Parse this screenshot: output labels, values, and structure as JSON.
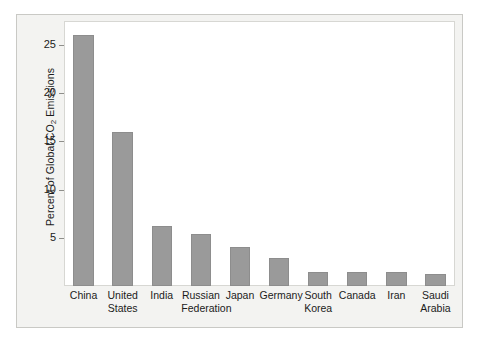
{
  "chart_data": {
    "type": "bar",
    "title": "",
    "xlabel": "",
    "ylabel": "Percent of Global CO2 Emissions",
    "ylabel_parts": {
      "before": "Percent of Global CO",
      "sub": "2",
      "after": " Emissions"
    },
    "categories": [
      "China",
      "United\nStates",
      "India",
      "Russian\nFederation",
      "Japan",
      "Germany",
      "South\nKorea",
      "Canada",
      "Iran",
      "Saudi\nArabia"
    ],
    "values": [
      26.0,
      16.0,
      6.2,
      5.4,
      4.0,
      2.9,
      1.5,
      1.5,
      1.5,
      1.2
    ],
    "ylim": [
      0,
      27.5
    ],
    "yticks": [
      5,
      10,
      15,
      20,
      25
    ],
    "ytick_labels": [
      "5",
      "10",
      "15",
      "20",
      "25"
    ],
    "grid": false,
    "legend": false,
    "bar_color": "#9a9a9a",
    "bar_edge_color": "#8d8d8d",
    "panel_background": "#ffffff",
    "figure_background": "#f3f3f1",
    "frame_color": "#c9c9c5",
    "text_color": "#1b1b1b"
  }
}
